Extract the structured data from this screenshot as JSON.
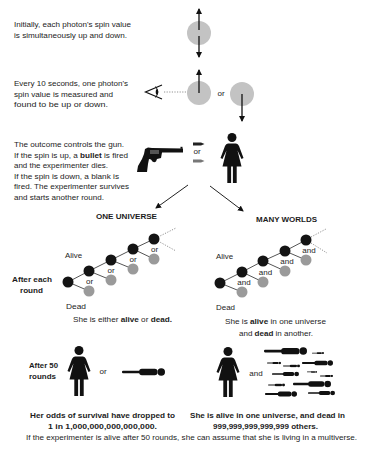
{
  "colors": {
    "text": "#1c1c1c",
    "photon": "#c3c3c3",
    "alive_node": "#141414",
    "dead_node": "#9a9a9a",
    "background": "#ffffff"
  },
  "steps": {
    "initial": {
      "lines": [
        "Initially, each photon's spin value",
        "is simultaneously up and down."
      ]
    },
    "measure": {
      "lines": [
        "Every 10 seconds, one photon's",
        "spin value is measured and",
        "found to be up or down."
      ],
      "or_label": "or"
    },
    "gun": {
      "line1": "The outcome controls the gun.",
      "line2_pre": "If the spin is up, a ",
      "line2_bold": "bullet",
      "line2_post": " is fired",
      "line3": "and the experimenter dies.",
      "line4": "If the spin is down, a blank is",
      "line5": "fired. The experimenter survives",
      "line6": "and starts another round.",
      "or_label": "or"
    }
  },
  "branches": {
    "one_universe": {
      "title": "ONE UNIVERSE",
      "alive_label": "Alive",
      "dead_label": "Dead",
      "connector": "or",
      "summary_pre": "She is either ",
      "summary_bold1": "alive",
      "summary_mid": " or ",
      "summary_bold2": "dead."
    },
    "many_worlds": {
      "title": "MANY WORLDS",
      "alive_label": "Alive",
      "dead_label": "Dead",
      "connector": "and",
      "summary_line1_pre": "She is ",
      "summary_line1_bold": "alive",
      "summary_line1_post": " in one universe",
      "summary_line2_pre": "and ",
      "summary_line2_bold": "dead",
      "summary_line2_post": " in another."
    }
  },
  "row_labels": {
    "after_each_round": [
      "After each",
      "round"
    ],
    "after_50_rounds": [
      "After 50",
      "rounds"
    ]
  },
  "outcomes": {
    "one_universe": {
      "connector": "or",
      "line1": "Her odds of survival have dropped to",
      "line2": "1 in 1,000,000,000,000,000."
    },
    "many_worlds": {
      "connector": "and",
      "line1": "She is alive in one universe, and dead in",
      "line2": "999,999,999,999,999 others."
    }
  },
  "conclusion": "If the experimenter is alive after 50 rounds, she can assume that she is living in a multiverse."
}
